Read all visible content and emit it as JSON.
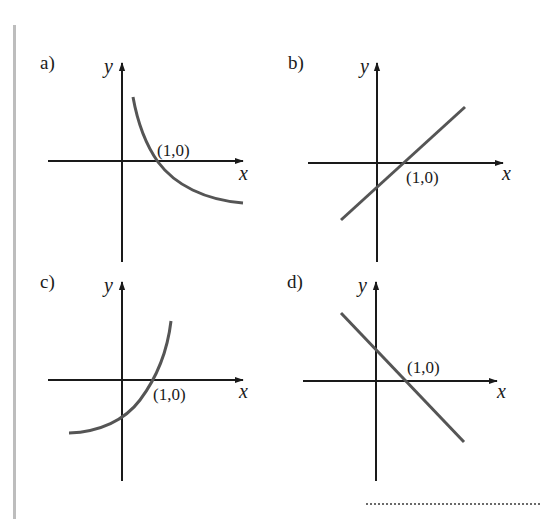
{
  "figure": {
    "panels": [
      {
        "id": "a",
        "label": "a)",
        "x_axis_label": "x",
        "y_axis_label": "y",
        "point_label": "(1,0)",
        "curve_type": "decreasing-curve",
        "description": "Decreasing concave-up curve crossing x-axis at (1,0), defined for x>0"
      },
      {
        "id": "b",
        "label": "b)",
        "x_axis_label": "x",
        "y_axis_label": "y",
        "point_label": "(1,0)",
        "curve_type": "increasing-line",
        "description": "Straight line with positive slope through (1,0)"
      },
      {
        "id": "c",
        "label": "c)",
        "x_axis_label": "x",
        "y_axis_label": "y",
        "point_label": "(1,0)",
        "curve_type": "increasing-curve",
        "description": "Increasing concave-up curve crossing x-axis at (1,0)"
      },
      {
        "id": "d",
        "label": "d)",
        "x_axis_label": "x",
        "y_axis_label": "y",
        "point_label": "(1,0)",
        "curve_type": "decreasing-line",
        "description": "Straight line with negative slope through (1,0)"
      }
    ],
    "colors": {
      "axis": "#1a1a1a",
      "curve": "#555555",
      "side_bar": "#bdbdbd",
      "dotted_line": "#6a6a6a"
    }
  }
}
